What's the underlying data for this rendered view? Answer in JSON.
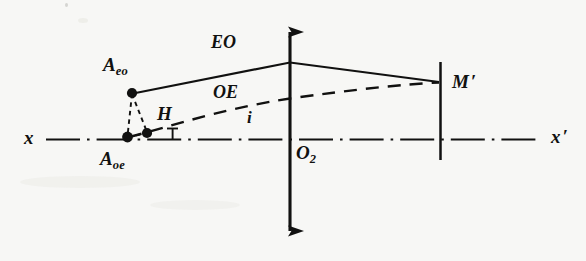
{
  "figure": {
    "kind": "optical-ray-diagram",
    "width": 586,
    "height": 261,
    "background_color": "#f7f7f5",
    "ink_color": "#111110"
  },
  "axis": {
    "label_left": "x",
    "label_right": "x",
    "label_right_prime": "′",
    "style": "dash-dot",
    "y": 139
  },
  "optical_axis_vertical": {
    "name": "double-headed vertical arrow",
    "x": 290,
    "top": 18,
    "bottom": 245
  },
  "points": {
    "origin": {
      "label": "O",
      "sub": "2",
      "x": 290,
      "y": 139
    },
    "source_eo": {
      "label": "A",
      "sub": "eo",
      "x": 132,
      "y": 93
    },
    "foot_h": {
      "label": "H",
      "x": 147,
      "y": 133
    },
    "source_oe": {
      "label": "A",
      "sub": "oe",
      "x": 127,
      "y": 137
    },
    "mirror_image": {
      "label": "M",
      "prime": "′",
      "x": 440,
      "y": 82
    }
  },
  "rays": [
    {
      "name": "EO",
      "label": "EO",
      "style": "solid"
    },
    {
      "name": "OE",
      "label": "OE",
      "style": "dashed"
    }
  ],
  "angle": {
    "label": "i",
    "vertex_x": 173,
    "vertex_y": 139
  },
  "mirror_line": {
    "name": "M-prime-plane",
    "x": 440,
    "top": 62,
    "bottom": 160
  }
}
